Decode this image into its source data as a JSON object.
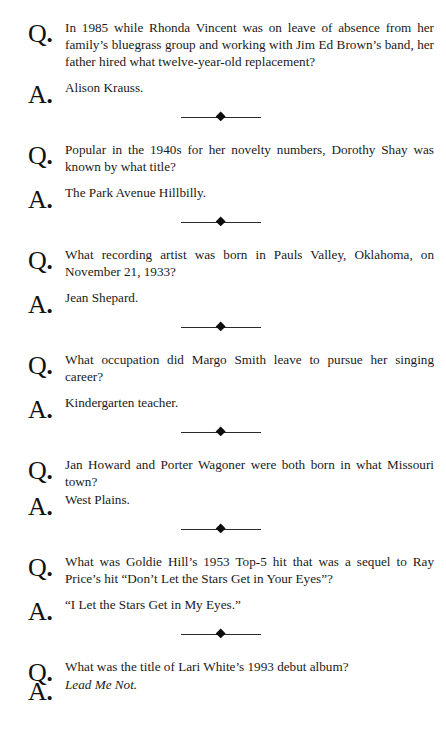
{
  "page": {
    "background_color": "#ffffff",
    "text_color": "#1a1a1a",
    "question_marker": "Q.",
    "answer_marker": "A.",
    "separator_icon": "diamond-rule-separator"
  },
  "entries": [
    {
      "question": "In 1985 while Rhonda Vincent was on leave of absence from her family’s bluegrass group and working with Jim Ed Brown’s band, her father hired what twelve-year-old replacement?",
      "answer": "Alison Krauss.",
      "answer_italic": false
    },
    {
      "question": "Popular in the 1940s for her novelty numbers, Dorothy Shay was known by what title?",
      "answer": "The Park Avenue Hillbilly.",
      "answer_italic": false
    },
    {
      "question": "What recording artist was born in Pauls Valley, Oklahoma, on November 21, 1933?",
      "answer": "Jean Shepard.",
      "answer_italic": false
    },
    {
      "question": "What occupation did Margo Smith leave to pursue her singing career?",
      "answer": "Kindergarten teacher.",
      "answer_italic": false
    },
    {
      "question": "Jan Howard and Porter Wagoner were both born in what Missouri town?",
      "answer": "West Plains.",
      "answer_italic": false
    },
    {
      "question": "What was Goldie Hill’s 1953 Top-5 hit that was a sequel to Ray Price’s hit “Don’t Let the Stars Get in Your Eyes”?",
      "answer": "“I Let the Stars Get in My Eyes.”",
      "answer_italic": false
    },
    {
      "question": "What was the title of Lari White’s 1993 debut album?",
      "answer": "Lead Me Not.",
      "answer_italic": true
    }
  ]
}
